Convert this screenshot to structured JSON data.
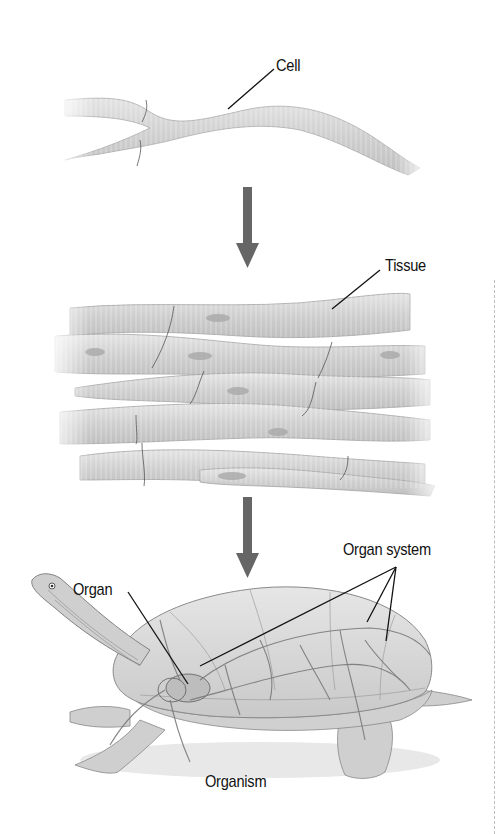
{
  "diagram": {
    "levels": [
      {
        "id": "cell",
        "label": "Cell"
      },
      {
        "id": "tissue",
        "label": "Tissue"
      },
      {
        "id": "organ",
        "label": "Organ"
      },
      {
        "id": "organ_system",
        "label": "Organ system"
      },
      {
        "id": "organism",
        "label": "Organism"
      }
    ],
    "arrows": [
      {
        "from": "cell",
        "to": "tissue"
      },
      {
        "from": "tissue",
        "to": "organ_system"
      }
    ],
    "colors": {
      "arrow": "#666666",
      "fiber_fill": "#d4d4d4",
      "fiber_stroke": "#9a9a9a",
      "label_text": "#111111",
      "leader_line": "#111111"
    }
  }
}
